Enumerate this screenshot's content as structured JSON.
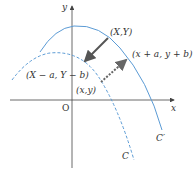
{
  "diagram": {
    "type": "curve-translation",
    "colors": {
      "axis": "#444444",
      "curve_c_prime": "#5b9bd5",
      "curve_c": "#5b9bd5",
      "arrow_solid": "#555555",
      "arrow_dashed": "#666666",
      "text": "#333333"
    },
    "axes": {
      "x_label": "x",
      "y_label": "y",
      "origin_label": "O"
    },
    "curves": [
      {
        "name": "C'",
        "label": "C′",
        "style": "solid"
      },
      {
        "name": "C",
        "label": "C",
        "style": "dashed"
      }
    ],
    "points": {
      "p_XY": "(X,Y)",
      "p_XaYb": "(X − a, Y − b)",
      "p_xy": "(x,y)",
      "p_xayb": "(x + a, y + b)"
    },
    "arrows": [
      {
        "from": "(X,Y)",
        "to": "(X − a, Y − b)",
        "style": "solid"
      },
      {
        "from": "(x,y)",
        "to": "(x + a, y + b)",
        "style": "dashed"
      }
    ]
  }
}
